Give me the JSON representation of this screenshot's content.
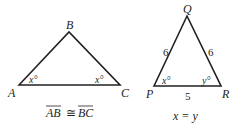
{
  "figure1": {
    "vertices": {
      "A": "A",
      "B": "B",
      "C": "C"
    },
    "angle_A": "x°",
    "angle_C": "x°",
    "caption_left": "AB",
    "caption_sym": "≅",
    "caption_right": "BC"
  },
  "figure2": {
    "vertices": {
      "P": "P",
      "Q": "Q",
      "R": "R"
    },
    "side_PQ": "6",
    "side_QR": "6",
    "side_PR": "5",
    "angle_P": "x°",
    "angle_R": "y°",
    "caption": "x = y"
  },
  "colors": {
    "stroke": "#231f20"
  }
}
